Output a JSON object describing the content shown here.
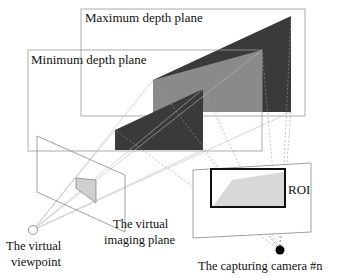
{
  "diagram": {
    "labels": {
      "max_plane": "Maximum depth plane",
      "min_plane": "Minimum depth plane",
      "roi": "ROI",
      "virtual_imaging_plane_line1": "The virtual",
      "virtual_imaging_plane_line2": "imaging plane",
      "virtual_viewpoint_line1": "The virtual",
      "virtual_viewpoint_line2": "viewpoint",
      "capturing_camera": "The capturing camera #n"
    },
    "colors": {
      "dark_fill": "#3a3a3a",
      "mid_fill": "#8a8a8a",
      "light_fill": "#d8d8d8",
      "line": "#888888",
      "roi_border": "#111111"
    }
  }
}
